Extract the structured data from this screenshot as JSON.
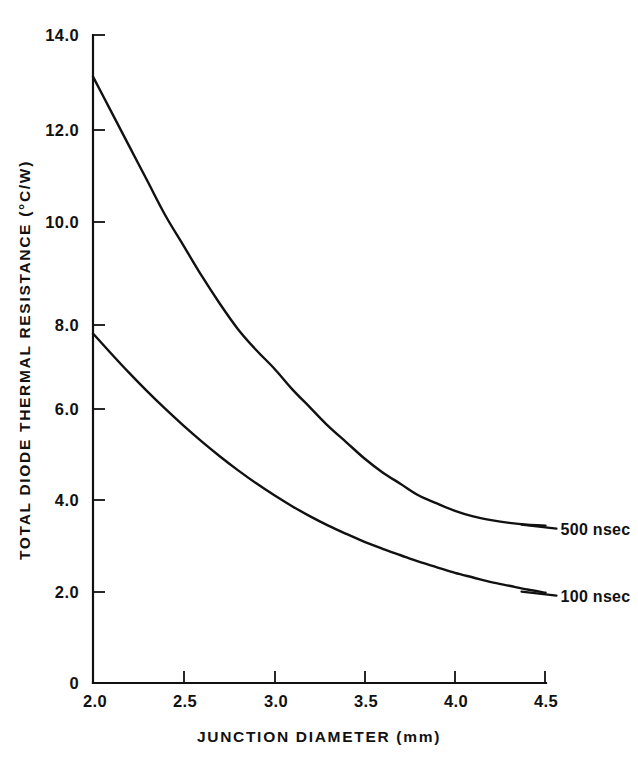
{
  "figure": {
    "background_color": "#ffffff",
    "ink_color": "#111111"
  },
  "chart_data": {
    "type": "line",
    "title": "",
    "xlabel": "JUNCTION DIAMETER (mm)",
    "ylabel": "TOTAL DIODE THERMAL RESISTANCE  (°C/W)",
    "xlim": [
      2.0,
      4.5
    ],
    "ylim": [
      0,
      14.0
    ],
    "grid": false,
    "legend_position": "right-inline-labels",
    "xticks": [
      2.0,
      2.5,
      3.0,
      3.5,
      4.0,
      4.5
    ],
    "xtick_labels": [
      "2.0",
      "2.5",
      "3.0",
      "3.5",
      "4.0",
      "4.5"
    ],
    "yticks": [
      0,
      2.0,
      4.0,
      6.0,
      8.0,
      10.0,
      12.0,
      14.0
    ],
    "ytick_labels": [
      "0",
      "2.0",
      "4.0",
      "6.0",
      "8.0",
      "10.0",
      "12.0",
      "14.0"
    ],
    "x": [
      2.0,
      2.1,
      2.2,
      2.3,
      2.4,
      2.5,
      2.6,
      2.7,
      2.8,
      2.9,
      3.0,
      3.1,
      3.2,
      3.3,
      3.4,
      3.5,
      3.6,
      3.7,
      3.8,
      3.9,
      4.0,
      4.1,
      4.2,
      4.3,
      4.4,
      4.5
    ],
    "series": [
      {
        "name": "500 nsec",
        "label": "500 nsec",
        "color": "#111111",
        "values": [
          13.1,
          12.35,
          11.6,
          10.85,
          10.1,
          9.45,
          8.8,
          8.2,
          7.65,
          7.2,
          6.8,
          6.35,
          5.95,
          5.55,
          5.2,
          4.85,
          4.55,
          4.3,
          4.05,
          3.88,
          3.72,
          3.6,
          3.52,
          3.46,
          3.42,
          3.4
        ]
      },
      {
        "name": "100 nsec",
        "label": "100 nsec",
        "color": "#111111",
        "values": [
          7.55,
          7.12,
          6.7,
          6.3,
          5.92,
          5.56,
          5.22,
          4.9,
          4.6,
          4.32,
          4.06,
          3.82,
          3.6,
          3.4,
          3.22,
          3.05,
          2.9,
          2.76,
          2.62,
          2.5,
          2.38,
          2.28,
          2.18,
          2.1,
          2.02,
          1.95
        ]
      }
    ],
    "annotations": [
      {
        "text": "500 nsec",
        "x": 4.5,
        "y": 3.4
      },
      {
        "text": "100 nsec",
        "x": 4.5,
        "y": 1.95
      }
    ]
  }
}
